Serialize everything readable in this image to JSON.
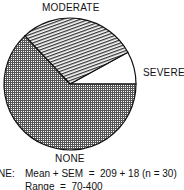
{
  "chart_data": {
    "type": "pie",
    "title": "",
    "slices": [
      {
        "label": "NONE",
        "percent": 63,
        "pattern": "crosshatch-dots"
      },
      {
        "label": "MODERATE",
        "percent": 29,
        "pattern": "diagonal-lines"
      },
      {
        "label": "SEVERE",
        "percent": 8,
        "pattern": "none"
      }
    ],
    "annotation": {
      "prefix": "NE:",
      "line1": "Mean + SEM  =  209 + 18 (n = 30)",
      "line2": "Range  =  70-400"
    }
  },
  "labels": {
    "moderate": "MODERATE",
    "severe": "SEVERE",
    "none": "NONE"
  }
}
